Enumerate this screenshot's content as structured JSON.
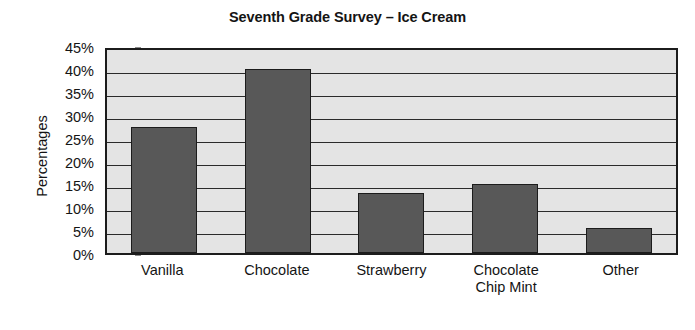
{
  "chart_data": {
    "type": "bar",
    "title": "Seventh Grade Survey – Ice Cream",
    "xlabel": "",
    "ylabel": "Percentages",
    "categories": [
      "Vanilla",
      "Chocolate",
      "Strawberry",
      "Chocolate\nChip Mint",
      "Other"
    ],
    "values": [
      27.5,
      40,
      13,
      15,
      5.5
    ],
    "ylim": [
      0,
      45
    ],
    "ytick_values": [
      0,
      5,
      10,
      15,
      20,
      25,
      30,
      35,
      40,
      45
    ],
    "ytick_labels": [
      "0%",
      "5%",
      "10%",
      "15%",
      "20%",
      "25%",
      "30%",
      "35%",
      "40%",
      "45%"
    ],
    "grid": true,
    "legend": "none",
    "colors": {
      "bar_fill": "#585858",
      "bar_border": "#1c1c1c",
      "plot_background": "#e4e4e4",
      "gridline": "#2a2a2a",
      "text": "#141414"
    }
  }
}
